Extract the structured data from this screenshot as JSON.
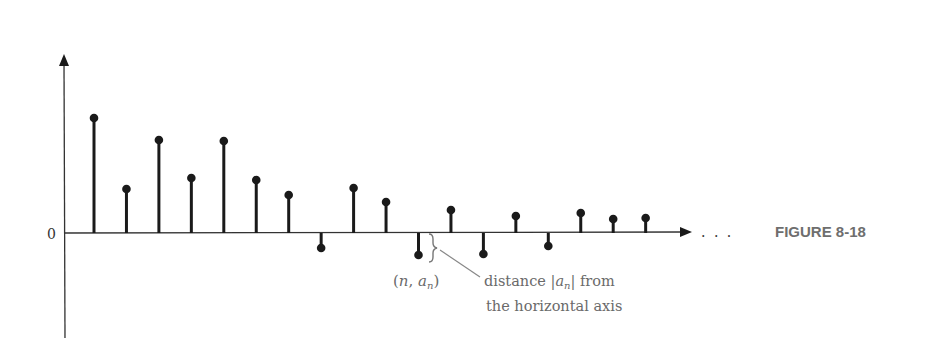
{
  "figure": {
    "label": "FIGURE 8-18",
    "zero_label": "0",
    "ellipsis": ". . .",
    "point_label_open": "(",
    "point_label_n": "n",
    "point_label_sep": ", ",
    "point_label_a": "a",
    "point_label_sub": "n",
    "point_label_close": ")",
    "annotation_line1_pre": "distance |",
    "annotation_line1_a": "a",
    "annotation_line1_sub": "n",
    "annotation_line1_post": "| from",
    "annotation_line2": "the horizontal axis"
  },
  "chart_data": {
    "type": "stem",
    "title": "",
    "xlabel": "",
    "ylabel": "",
    "y_tick_labels": [
      "0"
    ],
    "x": [
      1,
      2,
      3,
      4,
      5,
      6,
      7,
      8,
      9,
      10,
      11,
      12,
      13,
      14,
      15,
      16,
      17,
      18
    ],
    "values": [
      115,
      44,
      93,
      55,
      92,
      53,
      38,
      -15,
      45,
      31,
      -22,
      23,
      -21,
      17,
      -13,
      20,
      14,
      15
    ],
    "units": "relative height (pixels above axis)",
    "annotations": [
      {
        "text": "(n, a_n)",
        "target_index": 11
      },
      {
        "text": "distance |a_n| from the horizontal axis",
        "target_index": 11
      }
    ],
    "grid": false,
    "legend": null,
    "continues": "..."
  },
  "colors": {
    "ink": "#1a1a1a",
    "annotation": "#6a6a6a",
    "figure_label": "#6e6e6e"
  }
}
